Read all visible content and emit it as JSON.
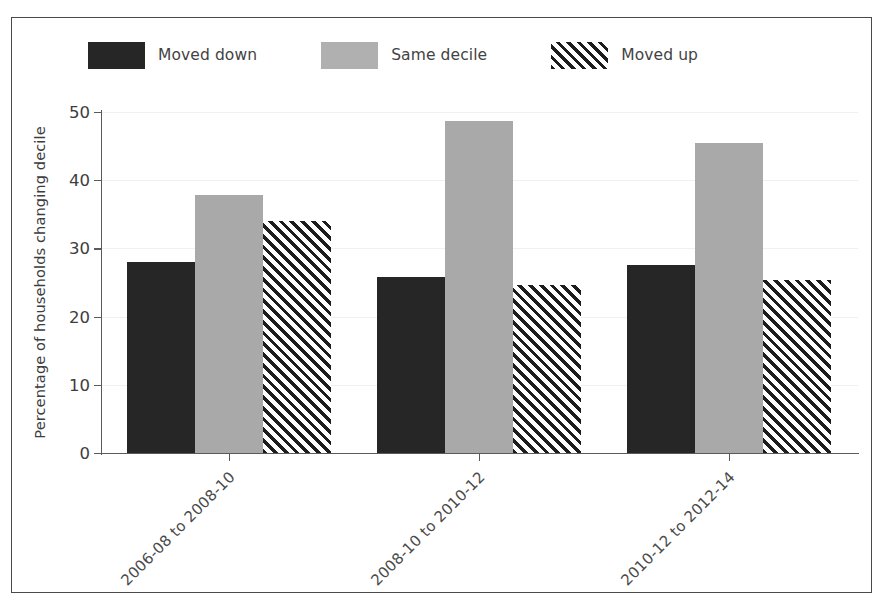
{
  "chart_data": {
    "type": "bar",
    "title": "",
    "xlabel": "",
    "ylabel": "Percentage of households changing decile",
    "categories": [
      "2006-08 to 2008-10",
      "2008-10 to 2010-12",
      "2010-12 to 2012-14"
    ],
    "series": [
      {
        "name": "Moved down",
        "values": [
          28.0,
          25.8,
          27.5
        ],
        "color": "#262626",
        "fill": "solid"
      },
      {
        "name": "Same decile",
        "values": [
          37.9,
          48.7,
          45.4
        ],
        "color": "#a9a9a9",
        "fill": "solid"
      },
      {
        "name": "Moved up",
        "values": [
          34.0,
          24.7,
          25.4
        ],
        "color": "#1d1d1d",
        "fill": "diagonal-hatch"
      }
    ],
    "ylim": [
      0,
      50
    ],
    "yticks": [
      0,
      10,
      20,
      30,
      40,
      50
    ],
    "ytick_labels": [
      "0",
      "10",
      "20",
      "30",
      "40",
      "50"
    ],
    "grid": "horizontal-faint",
    "legend_position": "top-left-above-axes",
    "xtick_label_rotation": -45
  },
  "legend": {
    "items": [
      {
        "label": "Moved down",
        "swatch": "solid-dark-swatch"
      },
      {
        "label": "Same decile",
        "swatch": "solid-grey-swatch"
      },
      {
        "label": "Moved up",
        "swatch": "hatched-swatch"
      }
    ]
  }
}
